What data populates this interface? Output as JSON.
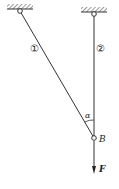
{
  "diagram": {
    "bars": [
      {
        "id": "bar-1",
        "label": "①"
      },
      {
        "id": "bar-2",
        "label": "②"
      }
    ],
    "angle_label": "α",
    "joint_label": "B",
    "force_label": "F",
    "colors": {
      "line": "#333333",
      "hatch": "#555555",
      "background": "#ffffff"
    }
  }
}
